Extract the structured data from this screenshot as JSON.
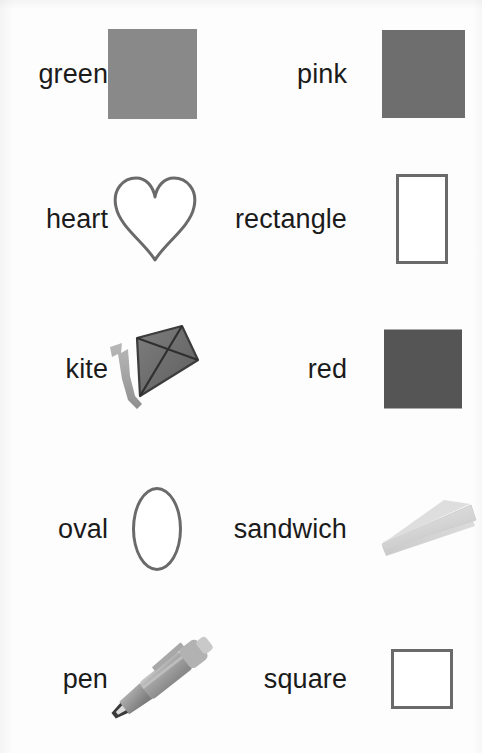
{
  "page": {
    "background_color": "#fdfdfd",
    "text_color": "#1b1b1b",
    "outline_color": "#6a6a6a",
    "columns": 2,
    "rows": 5
  },
  "items": [
    {
      "label": "green",
      "art": "filled-square",
      "art_name": "green-color-swatch",
      "color": "#898989",
      "column": "left",
      "row": 1
    },
    {
      "label": "pink",
      "art": "filled-square",
      "art_name": "pink-color-swatch",
      "color": "#6e6e6e",
      "column": "right",
      "row": 1
    },
    {
      "label": "heart",
      "art": "heart-outline",
      "art_name": "heart-shape",
      "color": "#6a6a6a",
      "column": "left",
      "row": 2
    },
    {
      "label": "rectangle",
      "art": "rect-outline",
      "art_name": "rectangle-shape",
      "color": "#6a6a6a",
      "column": "right",
      "row": 2
    },
    {
      "label": "kite",
      "art": "kite-photo",
      "art_name": "kite-picture",
      "color": "#6f6f6f",
      "column": "left",
      "row": 3
    },
    {
      "label": "red",
      "art": "filled-square",
      "art_name": "red-color-swatch",
      "color": "#555555",
      "column": "right",
      "row": 3
    },
    {
      "label": "oval",
      "art": "oval-outline",
      "art_name": "oval-shape",
      "color": "#6a6a6a",
      "column": "left",
      "row": 4
    },
    {
      "label": "sandwich",
      "art": "sandwich-photo",
      "art_name": "sandwich-picture",
      "color": "#d7d7d7",
      "column": "right",
      "row": 4
    },
    {
      "label": "pen",
      "art": "pen-photo",
      "art_name": "pen-picture",
      "color": "#9a9a9a",
      "column": "left",
      "row": 5
    },
    {
      "label": "square",
      "art": "square-outline",
      "art_name": "square-shape",
      "color": "#6a6a6a",
      "column": "right",
      "row": 5
    }
  ]
}
